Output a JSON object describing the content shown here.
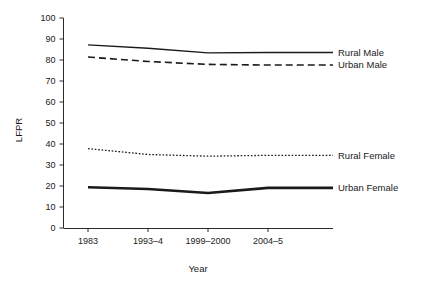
{
  "chart_data": {
    "type": "line",
    "title": "",
    "xlabel": "Year",
    "ylabel": "LFPR",
    "categories": [
      "1983",
      "1993–4",
      "1999–2000",
      "2004–5"
    ],
    "ylim": [
      0,
      100
    ],
    "yticks": [
      "0",
      "10",
      "20",
      "30",
      "40",
      "50",
      "60",
      "70",
      "80",
      "90",
      "100"
    ],
    "grid": false,
    "legend_position": "inline-right",
    "series": [
      {
        "name": "Rural Male",
        "values": [
          87.2,
          85.6,
          83.4,
          83.6
        ],
        "style": "solid",
        "color": "#1a1a1a"
      },
      {
        "name": "Urban Male",
        "values": [
          81.4,
          79.3,
          77.9,
          77.6
        ],
        "style": "dashed",
        "color": "#1a1a1a"
      },
      {
        "name": "Rural Female",
        "values": [
          37.8,
          35.0,
          34.2,
          34.6
        ],
        "style": "dotted",
        "color": "#1a1a1a"
      },
      {
        "name": "Urban Female",
        "values": [
          19.4,
          18.6,
          16.7,
          19.1
        ],
        "style": "thick-solid",
        "color": "#1a1a1a"
      }
    ]
  },
  "axes": {
    "y_label": "LFPR",
    "x_label": "Year"
  }
}
